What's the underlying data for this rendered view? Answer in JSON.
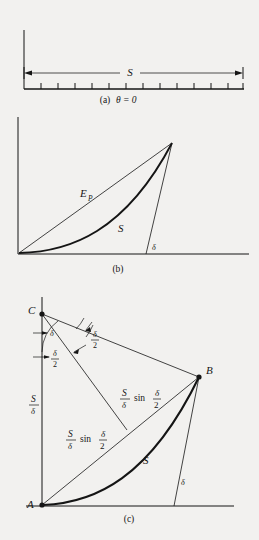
{
  "figure": {
    "background_color": "#f2f1ef",
    "ink_color": "#151515",
    "panels": [
      {
        "id": "a",
        "caption": "(a)",
        "condition": "θ = 0",
        "labels": {
          "span": "S"
        },
        "description": "straight horizontal ruled axis with tick marks and a double-headed dimension arrow labelled S",
        "tick_count": 13
      },
      {
        "id": "b",
        "caption": "(b)",
        "labels": {
          "chord": "E",
          "chord_sub": "P",
          "curve": "S",
          "angle": "δ"
        },
        "description": "curved beam from origin rising to upper right; straight chord labelled E sub P; end tangent meets baseline at angle delta"
      },
      {
        "id": "c",
        "caption": "(c)",
        "points": [
          "C",
          "B",
          "A"
        ],
        "labels": {
          "radius_num": "S",
          "radius_den": "δ",
          "angle_full": "δ",
          "angle_half_num": "δ",
          "angle_half_den": "2",
          "chord_num": "S",
          "chord_den": "δ",
          "chord_sin": "sin",
          "chord_half_num": "δ",
          "chord_half_den": "2",
          "curve": "S",
          "angle_end": "δ"
        },
        "description": "circular-arc model: centre C at top left, arc from A to B, two equal chords of length (S/delta) sin(delta/2), radius S/delta, subtended half-angles delta/2"
      }
    ]
  }
}
